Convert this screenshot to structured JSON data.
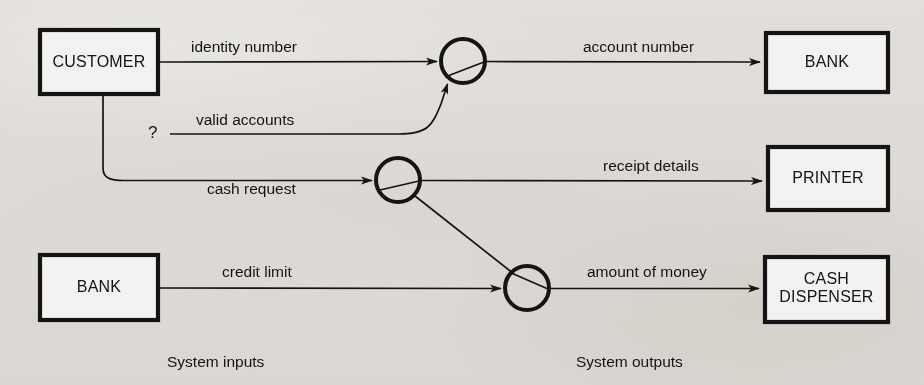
{
  "diagram": {
    "type": "data-flow-diagram",
    "title": "",
    "background_color": "#eeecea",
    "stroke_color": "#141414",
    "fill_color": "#f4f2f0",
    "entities": [
      {
        "id": "customer",
        "label": "CUSTOMER",
        "side": "input",
        "shape": "rectangle",
        "x": 40,
        "y": 30,
        "w": 118,
        "h": 64
      },
      {
        "id": "bank-input",
        "label": "BANK",
        "side": "input",
        "shape": "rectangle",
        "x": 40,
        "y": 255,
        "w": 118,
        "h": 65
      },
      {
        "id": "bank-output",
        "label": "BANK",
        "side": "output",
        "shape": "rectangle",
        "x": 766,
        "y": 33,
        "w": 122,
        "h": 59
      },
      {
        "id": "printer",
        "label": "PRINTER",
        "side": "output",
        "shape": "rectangle",
        "x": 768,
        "y": 147,
        "w": 120,
        "h": 63
      },
      {
        "id": "cash-dispenser",
        "label": "CASH\nDISPENSER",
        "side": "output",
        "shape": "rectangle",
        "x": 765,
        "y": 257,
        "w": 123,
        "h": 65
      }
    ],
    "processes": [
      {
        "id": "process-1",
        "label": "",
        "shape": "circle",
        "cx": 463,
        "cy": 61,
        "r": 22
      },
      {
        "id": "process-2",
        "label": "",
        "shape": "circle",
        "cx": 398,
        "cy": 180,
        "r": 22
      },
      {
        "id": "process-3",
        "label": "",
        "shape": "circle",
        "cx": 527,
        "cy": 288,
        "r": 22
      }
    ],
    "flows": [
      {
        "id": "flow-identity-number",
        "label": "identity number",
        "from": "customer",
        "to": "process-1",
        "label_x": 270,
        "label_y": 38
      },
      {
        "id": "flow-account-number",
        "label": "account number",
        "from": "process-1",
        "to": "bank-output",
        "label_x": 654,
        "label_y": 38
      },
      {
        "id": "flow-valid-accounts",
        "label": "valid accounts",
        "from": "unknown",
        "to": "process-1",
        "label_x": 252,
        "label_y": 110
      },
      {
        "id": "flow-cash-request",
        "label": "cash request",
        "from": "customer",
        "to": "process-2",
        "label_x": 268,
        "label_y": 186
      },
      {
        "id": "flow-receipt-details",
        "label": "receipt details",
        "from": "process-2",
        "to": "printer",
        "label_x": 656,
        "label_y": 156
      },
      {
        "id": "flow-credit-limit",
        "label": "credit limit",
        "from": "bank-input",
        "to": "process-3",
        "label_x": 266,
        "label_y": 263
      },
      {
        "id": "flow-amount-of-money",
        "label": "amount of money",
        "from": "process-3",
        "to": "cash-dispenser",
        "label_x": 646,
        "label_y": 263
      },
      {
        "id": "flow-process2-to-process3",
        "label": "",
        "from": "process-2",
        "to": "process-3",
        "label_x": 0,
        "label_y": 0
      }
    ],
    "annotations": [
      {
        "id": "unknown-source-marker",
        "label": "?",
        "x": 148,
        "y": 124
      }
    ],
    "captions": [
      {
        "id": "caption-system-inputs",
        "label": "System inputs",
        "x": 225,
        "y": 353
      },
      {
        "id": "caption-system-outputs",
        "label": "System outputs",
        "x": 640,
        "y": 353
      }
    ]
  }
}
